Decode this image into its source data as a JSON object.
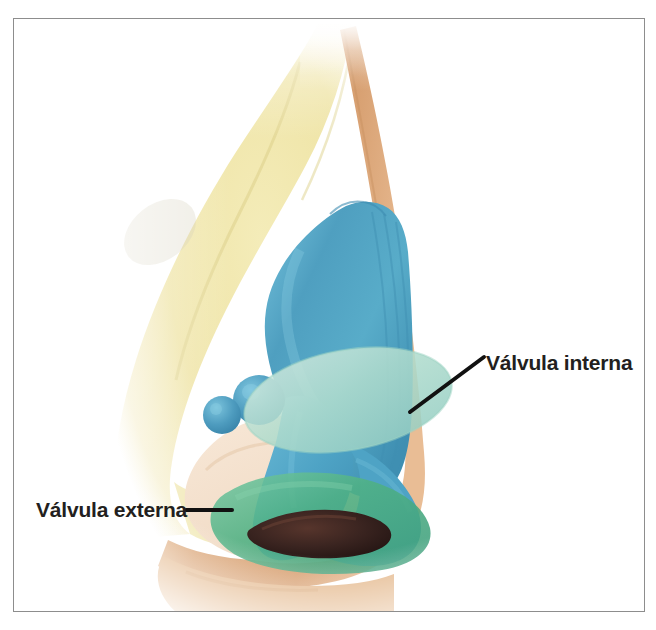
{
  "figure": {
    "frame": {
      "border_color": "#8d8d8d",
      "background": "#ffffff"
    }
  },
  "labels": {
    "internal_valve": "Válvula interna",
    "external_valve": "Válvula externa"
  },
  "leaders": {
    "internal_valve": {
      "x1": 484,
      "y1": 357,
      "x2": 410,
      "y2": 412
    },
    "external_valve": {
      "x1": 186,
      "y1": 510,
      "x2": 232,
      "y2": 510
    }
  },
  "structures": [
    {
      "name": "nasal-bone",
      "label": "Hueso nasal",
      "color": "#efe4a6"
    },
    {
      "name": "upper-lateral-cartilage",
      "label": "Cartílago lateral superior",
      "color": "#4f9fc0"
    },
    {
      "name": "lower-lateral-cartilage",
      "label": "Cartílago lateral inferior",
      "color": "#57aac8"
    },
    {
      "name": "sesamoid-cartilages",
      "label": "Cartílagos sesamoideos",
      "color": "#4e9cbf"
    },
    {
      "name": "internal-valve-region",
      "label": "Válvula interna",
      "color": "#b5ded1"
    },
    {
      "name": "external-valve-region",
      "label": "Válvula externa",
      "color": "#4fb184"
    },
    {
      "name": "skin-outline",
      "label": "Piel",
      "color": "#dca97d"
    },
    {
      "name": "soft-tissue",
      "label": "Tejido blando",
      "color": "#f2ddc8"
    },
    {
      "name": "nostril-opening",
      "label": "Narina",
      "color": "#3a2420"
    }
  ],
  "colors": {
    "bone_yellow": "#efe4a6",
    "cartilage_blue": "#57aac8",
    "cartilage_blue_dark": "#3f8fb2",
    "internal_valve_mint": "#b5ded1",
    "external_valve_green": "#4fb184",
    "skin_tan": "#dca97d",
    "soft_tissue": "#f2ddc8",
    "nostril_dark": "#3a2420",
    "label_text": "#231f20",
    "leader_line": "#111111",
    "frame": "#8d8d8d",
    "page_background": "#ffffff"
  }
}
